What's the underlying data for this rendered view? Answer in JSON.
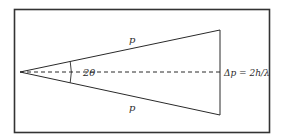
{
  "diagram": {
    "type": "geometric-diagram",
    "labels": {
      "upper_side": "p",
      "lower_side": "p",
      "apex_angle": "2θ",
      "base": "Δp = 2h/λ"
    },
    "elements": {
      "frame": {
        "x": 14,
        "y": 9,
        "width": 255,
        "height": 123
      },
      "apex": {
        "x": 20,
        "y": 72
      },
      "base_top": {
        "x": 220,
        "y": 30
      },
      "base_bottom": {
        "x": 220,
        "y": 115
      },
      "bisector": {
        "style": "dashed",
        "from": "apex",
        "to": "base-midpoint"
      },
      "angle_arc": {
        "center": "apex",
        "radius": 51
      }
    },
    "colors": {
      "stroke": "#2a2a2a",
      "frame": "#333333",
      "background": "#ffffff"
    }
  }
}
